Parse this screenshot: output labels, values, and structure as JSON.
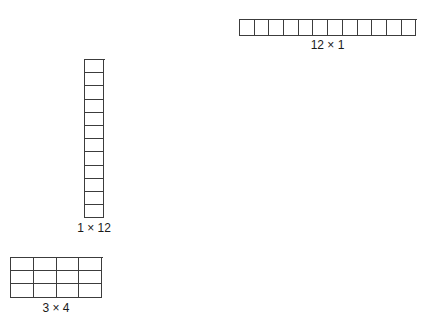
{
  "page": {
    "background_color": "#ffffff",
    "line_color": "#3c3c3c",
    "text_color": "#1a1a1a",
    "clipped_top_caption": ""
  },
  "arrays": [
    {
      "id": "12x1",
      "label": "12 × 1",
      "rows": 1,
      "cols": 12,
      "orientation": "horizontal",
      "total": 12
    },
    {
      "id": "1x12",
      "label": "1 × 12",
      "rows": 12,
      "cols": 1,
      "orientation": "vertical",
      "total": 12
    },
    {
      "id": "3x4",
      "label": "3 × 4",
      "rows": 3,
      "cols": 4,
      "orientation": "rectangle",
      "total": 12
    }
  ]
}
